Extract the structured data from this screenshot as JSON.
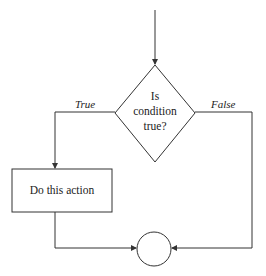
{
  "diagram": {
    "type": "flowchart",
    "title": "",
    "decision": {
      "lines": [
        "Is",
        "condition",
        "true?"
      ]
    },
    "branches": {
      "true_label": "True",
      "false_label": "False"
    },
    "action": {
      "label": "Do this action"
    },
    "merge": {
      "shape": "circle"
    },
    "colors": {
      "stroke": "#333333",
      "text": "#222222",
      "background": "#ffffff"
    }
  }
}
